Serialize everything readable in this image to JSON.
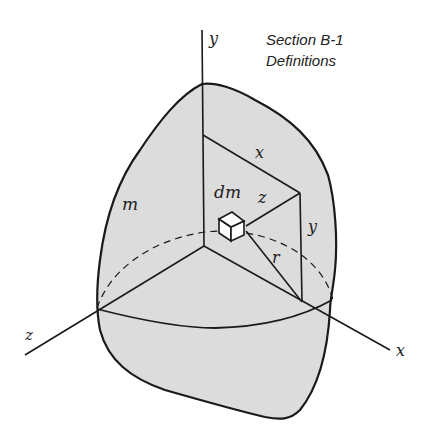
{
  "title": {
    "line1": "Section B-1",
    "line2": "Definitions"
  },
  "labels": {
    "y_axis": "y",
    "x_axis": "x",
    "z_axis": "z",
    "mass": "m",
    "mass_element": "dm",
    "x_distance": "x",
    "y_distance": "y",
    "z_distance": "z",
    "radius": "r"
  },
  "colors": {
    "body_fill": "#dcdcdc",
    "stroke": "#1a1a1a",
    "background": "#ffffff"
  }
}
